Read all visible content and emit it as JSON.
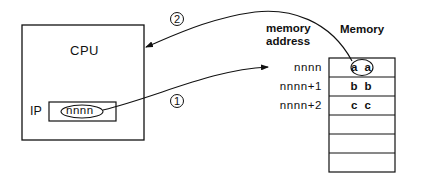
{
  "cpu": {
    "label": "CPU",
    "register": {
      "label": "IP",
      "value": "nnnn"
    }
  },
  "memory_header": {
    "address_label_line1": "memory",
    "address_label_line2": "address",
    "memory_label": "Memory"
  },
  "memory_rows": [
    {
      "address": "nnnn",
      "value": "a a"
    },
    {
      "address": "nnnn+1",
      "value": "b b"
    },
    {
      "address": "nnnn+2",
      "value": "c c"
    },
    {
      "address": "",
      "value": ""
    },
    {
      "address": "",
      "value": ""
    },
    {
      "address": "",
      "value": ""
    }
  ],
  "steps": [
    {
      "number": "1",
      "description": "IP value points to memory address nnnn"
    },
    {
      "number": "2",
      "description": "Contents at nnnn (a a) fetched into CPU"
    }
  ],
  "colors": {
    "ink": "#111111",
    "background": "#ffffff"
  }
}
